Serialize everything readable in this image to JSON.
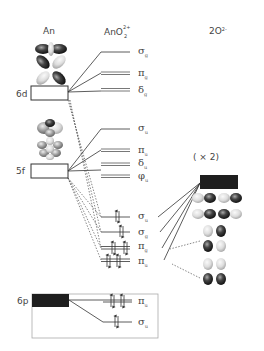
{
  "columns": {
    "left": "An",
    "middle": "AnO",
    "middle_sub": "2",
    "middle_sup": "2+",
    "right": "2O",
    "right_sup": "2-"
  },
  "atomic_orbitals": {
    "d": "6d",
    "f": "5f",
    "p": "6p"
  },
  "multiplier": "( × 2)",
  "mo_levels": {
    "sigma_g_top": {
      "sym": "σ",
      "sub": "g"
    },
    "pi_g_top": {
      "sym": "π",
      "sub": "g"
    },
    "delta_g": {
      "sym": "δ",
      "sub": "g"
    },
    "sigma_u_top": {
      "sym": "σ",
      "sub": "u"
    },
    "pi_u_top": {
      "sym": "π",
      "sub": "u"
    },
    "delta_u": {
      "sym": "δ",
      "sub": "u"
    },
    "phi_u": {
      "sym": "φ",
      "sub": "u"
    },
    "sigma_u_bond": {
      "sym": "σ",
      "sub": "u"
    },
    "sigma_g_bond": {
      "sym": "σ",
      "sub": "g"
    },
    "pi_g_bond": {
      "sym": "π",
      "sub": "g"
    },
    "pi_u_bond": {
      "sym": "π",
      "sub": "u"
    },
    "pi_u_6p": {
      "sym": "π",
      "sub": "u"
    },
    "sigma_u_6p": {
      "sym": "σ",
      "sub": "u"
    }
  },
  "colors": {
    "line": "#333333",
    "filled_box": "#1e1e1e",
    "frame": "#aaaaaa",
    "dotted": "#555555"
  }
}
